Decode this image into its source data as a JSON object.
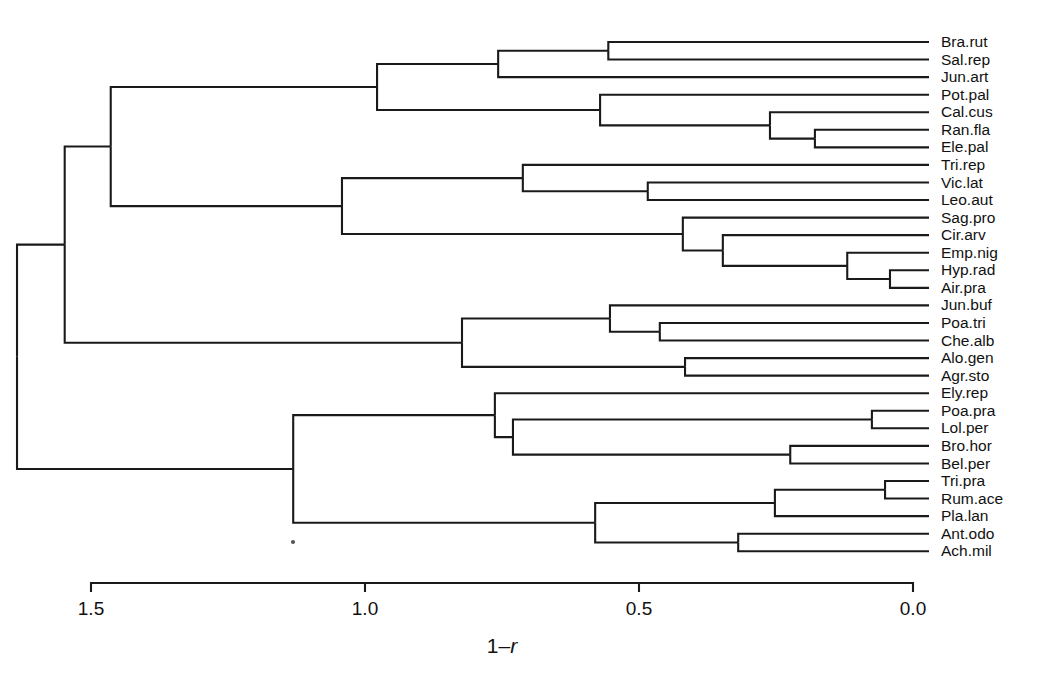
{
  "figure": {
    "type": "dendrogram",
    "title": "",
    "background_color": "#ffffff",
    "line_color": "#1a1a1a",
    "text_color": "#111111"
  },
  "axis": {
    "label_plain_prefix": "1",
    "label_minus": "–",
    "label_italic": "r",
    "label_full": "1–r",
    "ticks": [
      "1.5",
      "1.0",
      "0.5",
      "0.0"
    ],
    "tick_values": [
      1.5,
      1.0,
      0.5,
      0.0
    ],
    "range": [
      1.5,
      0.0
    ],
    "direction": "decreasing-left-to-right",
    "pixel_left": 91,
    "pixel_right": 913,
    "pixel_y": 583,
    "tick_length": 9
  },
  "chart_data": {
    "type": "dendrogram",
    "title": "",
    "xlabel": "1–r",
    "ylabel": "",
    "xlim": [
      1.5,
      0.0
    ],
    "grid": false,
    "legend": "none",
    "distance_metric": "1−r",
    "leaf_count": 30,
    "leaves": [
      "Bra.rut",
      "Sal.rep",
      "Jun.art",
      "Pot.pal",
      "Cal.cus",
      "Ran.fla",
      "Ele.pal",
      "Tri.rep",
      "Vic.lat",
      "Leo.aut",
      "Sag.pro",
      "Cir.arv",
      "Emp.nig",
      "Hyp.rad",
      "Air.pra",
      "Jun.buf",
      "Poa.tri",
      "Che.alb",
      "Alo.gen",
      "Agr.sto",
      "Ely.rep",
      "Poa.pra",
      "Lol.per",
      "Bro.hor",
      "Bel.per",
      "Tri.pra",
      "Rum.ace",
      "Pla.lan",
      "Ant.odo",
      "Ach.mil"
    ],
    "merges": [
      {
        "id": "n1",
        "children": [
          "Bra.rut",
          "Sal.rep"
        ],
        "height": 0.556
      },
      {
        "id": "n2",
        "children": [
          "n1",
          "Jun.art"
        ],
        "height": 0.757
      },
      {
        "id": "n3",
        "children": [
          "Ran.fla",
          "Ele.pal"
        ],
        "height": 0.179
      },
      {
        "id": "n4",
        "children": [
          "Cal.cus",
          "n3"
        ],
        "height": 0.261
      },
      {
        "id": "n5",
        "children": [
          "Pot.pal",
          "n4"
        ],
        "height": 0.571
      },
      {
        "id": "n6",
        "children": [
          "n2",
          "n5"
        ],
        "height": 0.978
      },
      {
        "id": "n7",
        "children": [
          "Vic.lat",
          "Leo.aut"
        ],
        "height": 0.484
      },
      {
        "id": "n8",
        "children": [
          "Tri.rep",
          "n7"
        ],
        "height": 0.712
      },
      {
        "id": "n9",
        "children": [
          "Hyp.rad",
          "Air.pra"
        ],
        "height": 0.042
      },
      {
        "id": "n10",
        "children": [
          "Emp.nig",
          "n9"
        ],
        "height": 0.12
      },
      {
        "id": "n11",
        "children": [
          "Cir.arv",
          "n10"
        ],
        "height": 0.347
      },
      {
        "id": "n12",
        "children": [
          "Sag.pro",
          "n11"
        ],
        "height": 0.42
      },
      {
        "id": "n13",
        "children": [
          "n8",
          "n12"
        ],
        "height": 1.042
      },
      {
        "id": "n14",
        "children": [
          "n6",
          "n13"
        ],
        "height": 1.464
      },
      {
        "id": "n15",
        "children": [
          "Poa.tri",
          "Che.alb"
        ],
        "height": 0.462
      },
      {
        "id": "n16",
        "children": [
          "Jun.buf",
          "n15"
        ],
        "height": 0.553
      },
      {
        "id": "n17",
        "children": [
          "Alo.gen",
          "Agr.sto"
        ],
        "height": 0.416
      },
      {
        "id": "n18",
        "children": [
          "n16",
          "n17"
        ],
        "height": 0.823
      },
      {
        "id": "n19",
        "children": [
          "n14",
          "n18"
        ],
        "height": 1.548
      },
      {
        "id": "n20",
        "children": [
          "Poa.pra",
          "Lol.per"
        ],
        "height": 0.075
      },
      {
        "id": "n21",
        "children": [
          "Bro.hor",
          "Bel.per"
        ],
        "height": 0.224
      },
      {
        "id": "n22",
        "children": [
          "n20",
          "n21"
        ],
        "height": 0.73
      },
      {
        "id": "n23",
        "children": [
          "Ely.rep",
          "n22"
        ],
        "height": 0.763
      },
      {
        "id": "n24",
        "children": [
          "Tri.pra",
          "Rum.ace"
        ],
        "height": 0.051
      },
      {
        "id": "n25",
        "children": [
          "n24",
          "Pla.lan"
        ],
        "height": 0.252
      },
      {
        "id": "n26",
        "children": [
          "Ant.odo",
          "Ach.mil"
        ],
        "height": 0.319
      },
      {
        "id": "n27",
        "children": [
          "n25",
          "n26"
        ],
        "height": 0.58
      },
      {
        "id": "n28",
        "children": [
          "n23",
          "n27"
        ],
        "height": 1.131
      },
      {
        "id": "n29",
        "children": [
          "n19",
          "n28"
        ],
        "height": 1.635
      }
    ]
  }
}
